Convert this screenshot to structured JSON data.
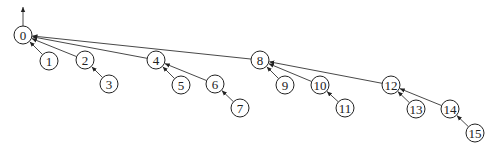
{
  "diagram": {
    "type": "binomial-tree",
    "root_arrow": {
      "from": [
        23,
        26
      ],
      "to": [
        23,
        7
      ]
    },
    "node_radius": 9,
    "nodes": [
      {
        "id": "0",
        "label": "0",
        "x": 23,
        "y": 35
      },
      {
        "id": "1",
        "label": "1",
        "x": 49,
        "y": 61
      },
      {
        "id": "2",
        "label": "2",
        "x": 85,
        "y": 60
      },
      {
        "id": "3",
        "label": "3",
        "x": 109,
        "y": 84
      },
      {
        "id": "4",
        "label": "4",
        "x": 156,
        "y": 60
      },
      {
        "id": "5",
        "label": "5",
        "x": 181,
        "y": 85
      },
      {
        "id": "6",
        "label": "6",
        "x": 215,
        "y": 84
      },
      {
        "id": "7",
        "label": "7",
        "x": 240,
        "y": 108
      },
      {
        "id": "8",
        "label": "8",
        "x": 260,
        "y": 60
      },
      {
        "id": "9",
        "label": "9",
        "x": 285,
        "y": 85
      },
      {
        "id": "10",
        "label": "10",
        "x": 320,
        "y": 85
      },
      {
        "id": "11",
        "label": "11",
        "x": 345,
        "y": 108
      },
      {
        "id": "12",
        "label": "12",
        "x": 391,
        "y": 85
      },
      {
        "id": "13",
        "label": "13",
        "x": 416,
        "y": 109
      },
      {
        "id": "14",
        "label": "14",
        "x": 450,
        "y": 109
      },
      {
        "id": "15",
        "label": "15",
        "x": 475,
        "y": 133
      }
    ],
    "edges": [
      {
        "child": "1",
        "parent": "0"
      },
      {
        "child": "2",
        "parent": "0"
      },
      {
        "child": "4",
        "parent": "0"
      },
      {
        "child": "8",
        "parent": "0"
      },
      {
        "child": "3",
        "parent": "2"
      },
      {
        "child": "5",
        "parent": "4"
      },
      {
        "child": "6",
        "parent": "4"
      },
      {
        "child": "7",
        "parent": "6"
      },
      {
        "child": "9",
        "parent": "8"
      },
      {
        "child": "10",
        "parent": "8"
      },
      {
        "child": "12",
        "parent": "8"
      },
      {
        "child": "11",
        "parent": "10"
      },
      {
        "child": "13",
        "parent": "12"
      },
      {
        "child": "14",
        "parent": "12"
      },
      {
        "child": "15",
        "parent": "14"
      }
    ],
    "colors": {
      "stroke": "#222222",
      "background": "#ffffff"
    }
  }
}
